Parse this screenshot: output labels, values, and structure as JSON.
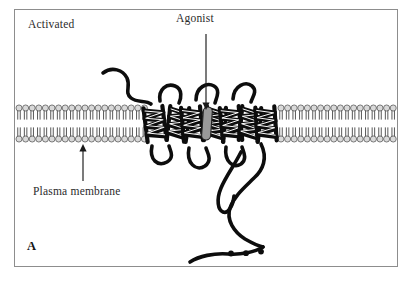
{
  "figure": {
    "panel_letter": "A",
    "state_label": "Activated",
    "labels": {
      "agonist": "Agonist",
      "plasma_membrane": "Plasma membrane"
    },
    "colors": {
      "frame_border": "#8d8d8d",
      "background": "#ffffff",
      "ink": "#111111",
      "text": "#2b2b2b",
      "lipid_head_fill": "#d9d9d9",
      "lipid_head_stroke": "#4a4a4a",
      "agonist_fill": "#9a9a9a",
      "agonist_stroke": "#222222",
      "leader_line": "#1a1a1a"
    },
    "diagram": {
      "type": "membrane-receptor-schematic",
      "subject": "G-protein-coupled receptor in activated state with bound agonist",
      "transmembrane_helix_count": 7,
      "bilayer_leaflets": 2,
      "palmitoyl_dots": 3,
      "elements": [
        "lipid-bilayer-left",
        "lipid-bilayer-right",
        "seven-transmembrane-helices",
        "agonist-molecule",
        "n-terminal-tail",
        "extracellular-loops",
        "intracellular-loops",
        "c-terminal-tail"
      ]
    },
    "annotations": [
      {
        "name": "agonist-pointer",
        "text": "Agonist",
        "points_to": "agonist-molecule"
      },
      {
        "name": "plasma-membrane-pointer",
        "text": "Plasma membrane",
        "points_to": "lipid-bilayer-left"
      }
    ]
  }
}
